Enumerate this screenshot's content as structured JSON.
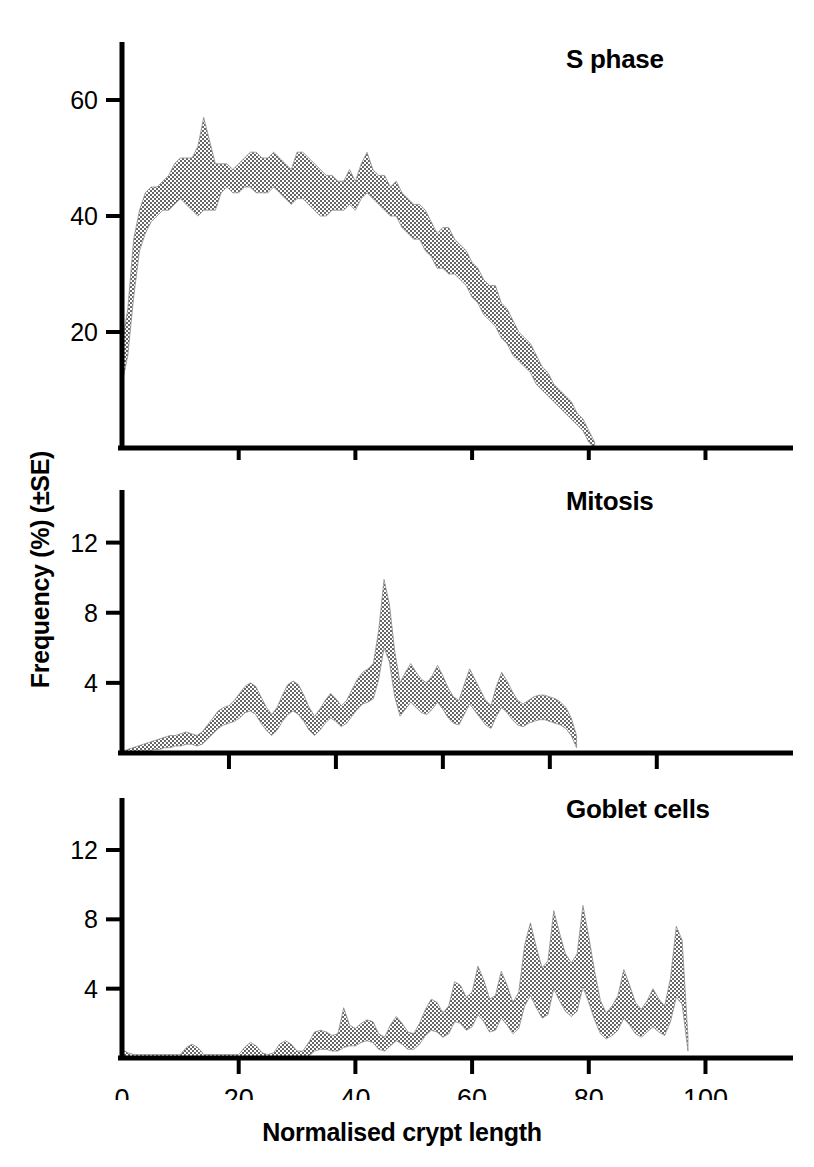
{
  "figure": {
    "xlabel": "Normalised crypt length",
    "ylabel": "Frequency (%) (±SE)",
    "band_color": "#a9a9a9",
    "axis_color": "#000000"
  },
  "chart_data": [
    {
      "type": "area",
      "title": "S phase",
      "xlabel": "Normalised crypt length",
      "ylabel": "Frequency (%) (±SE)",
      "xlim": [
        0,
        115
      ],
      "ylim": [
        0,
        70
      ],
      "xticks": [
        0,
        20,
        40,
        60,
        80,
        100
      ],
      "yticks": [
        20,
        40,
        60
      ],
      "grid": false,
      "legend": "none",
      "band": "±SE shaded region",
      "x": [
        0,
        1,
        2,
        3,
        4,
        5,
        6,
        7,
        8,
        9,
        10,
        11,
        12,
        13,
        14,
        15,
        16,
        17,
        18,
        19,
        20,
        21,
        22,
        23,
        24,
        25,
        26,
        27,
        28,
        29,
        30,
        31,
        32,
        33,
        34,
        35,
        36,
        37,
        38,
        39,
        40,
        41,
        42,
        43,
        44,
        45,
        46,
        47,
        48,
        49,
        50,
        51,
        52,
        53,
        54,
        55,
        56,
        57,
        58,
        59,
        60,
        61,
        62,
        63,
        64,
        65,
        66,
        67,
        68,
        69,
        70,
        71,
        72,
        73,
        74,
        75,
        76,
        77,
        78,
        79,
        80,
        81
      ],
      "upper": [
        18,
        24,
        36,
        41,
        44,
        45,
        45,
        46,
        47,
        49,
        50,
        50,
        50,
        52,
        57,
        53,
        49,
        49,
        49,
        48,
        49,
        50,
        51,
        51,
        50,
        50,
        51,
        50,
        49,
        48,
        51,
        51,
        50,
        49,
        48,
        47,
        47,
        46,
        46,
        48,
        46,
        49,
        51,
        48,
        47,
        47,
        45,
        46,
        44,
        43,
        42,
        42,
        41,
        39,
        37,
        38,
        38,
        36,
        35,
        34,
        32,
        31,
        29,
        28,
        28,
        25,
        24,
        22,
        20,
        19,
        18,
        16,
        14,
        13,
        11,
        10,
        9,
        8,
        6,
        5,
        3,
        1
      ],
      "lower": [
        11,
        16,
        26,
        34,
        37,
        39,
        40,
        41,
        41,
        42,
        43,
        42,
        41,
        40,
        41,
        41,
        41,
        44,
        45,
        44,
        44,
        45,
        45,
        44,
        44,
        44,
        45,
        44,
        43,
        42,
        43,
        43,
        42,
        41,
        40,
        40,
        41,
        41,
        41,
        42,
        41,
        43,
        44,
        43,
        42,
        41,
        40,
        40,
        38,
        37,
        36,
        36,
        34,
        33,
        31,
        31,
        30,
        30,
        29,
        28,
        26,
        25,
        23,
        22,
        21,
        19,
        18,
        16,
        15,
        14,
        13,
        11,
        10,
        9,
        8,
        7,
        6,
        5,
        4,
        3,
        1,
        0
      ],
      "mean": [
        14,
        20,
        31,
        37,
        40,
        42,
        42,
        43,
        44,
        45,
        46,
        46,
        45,
        46,
        49,
        47,
        45,
        46,
        47,
        46,
        46,
        47,
        48,
        47,
        47,
        47,
        48,
        47,
        46,
        45,
        47,
        47,
        46,
        45,
        44,
        43,
        44,
        43,
        43,
        45,
        43,
        46,
        47,
        45,
        44,
        44,
        42,
        43,
        41,
        40,
        39,
        39,
        37,
        36,
        34,
        34,
        34,
        33,
        32,
        31,
        29,
        28,
        26,
        25,
        24,
        22,
        21,
        19,
        17,
        16,
        15,
        13,
        12,
        11,
        9,
        8,
        7,
        6,
        5,
        4,
        2,
        0
      ]
    },
    {
      "type": "area",
      "title": "Mitosis",
      "xlabel": "Normalised crypt length",
      "ylabel": "Frequency (%) (±SE)",
      "xlim": [
        0,
        115
      ],
      "ylim": [
        0,
        15
      ],
      "xticks": [
        0,
        20,
        40,
        60,
        80,
        100
      ],
      "yticks": [
        4,
        8,
        12
      ],
      "grid": false,
      "legend": "none",
      "band": "±SE shaded region",
      "x": [
        0,
        1,
        2,
        3,
        4,
        5,
        6,
        7,
        8,
        9,
        10,
        11,
        12,
        13,
        14,
        15,
        16,
        17,
        18,
        19,
        20,
        21,
        22,
        23,
        24,
        25,
        26,
        27,
        28,
        29,
        30,
        31,
        32,
        33,
        34,
        35,
        36,
        37,
        38,
        39,
        40,
        41,
        42,
        43,
        44,
        45,
        46,
        47,
        48,
        49,
        50,
        51,
        52,
        53,
        54,
        55,
        56,
        57,
        58,
        59,
        60,
        61,
        62,
        63,
        64,
        65,
        66,
        67,
        68,
        69,
        70,
        71,
        72,
        73,
        74,
        75,
        76,
        77,
        78,
        79,
        80,
        81,
        82,
        83,
        84,
        85
      ],
      "upper": [
        0.1,
        0.2,
        0.3,
        0.4,
        0.5,
        0.6,
        0.7,
        0.8,
        0.9,
        1.0,
        1.0,
        1.1,
        1.2,
        1.1,
        1.0,
        1.2,
        1.6,
        2.0,
        2.4,
        2.6,
        2.7,
        3.0,
        3.4,
        3.8,
        4.0,
        3.8,
        3.2,
        2.6,
        2.2,
        2.6,
        3.3,
        3.9,
        4.1,
        3.9,
        3.3,
        2.6,
        2.1,
        2.5,
        3.0,
        3.4,
        3.1,
        2.7,
        3.0,
        3.6,
        4.2,
        4.6,
        4.8,
        5.1,
        7.0,
        9.9,
        8.5,
        5.8,
        4.0,
        4.6,
        5.1,
        4.6,
        4.2,
        4.0,
        4.4,
        5.0,
        4.4,
        3.7,
        3.2,
        3.0,
        3.9,
        4.8,
        4.2,
        3.6,
        3.0,
        2.7,
        3.8,
        4.6,
        4.1,
        3.5,
        3.0,
        2.8,
        3.0,
        3.2,
        3.3,
        3.3,
        3.2,
        3.1,
        2.9,
        2.6,
        2.0,
        1.0
      ],
      "lower": [
        0.0,
        0.0,
        0.0,
        0.0,
        0.1,
        0.1,
        0.2,
        0.2,
        0.3,
        0.3,
        0.4,
        0.4,
        0.5,
        0.5,
        0.4,
        0.5,
        0.8,
        1.1,
        1.4,
        1.6,
        1.7,
        1.8,
        2.0,
        2.3,
        2.4,
        2.2,
        1.7,
        1.3,
        1.0,
        1.3,
        1.8,
        2.2,
        2.4,
        2.2,
        1.8,
        1.3,
        1.0,
        1.3,
        1.7,
        2.0,
        1.8,
        1.5,
        1.7,
        2.1,
        2.5,
        2.8,
        2.9,
        3.1,
        4.2,
        6.0,
        5.2,
        3.2,
        2.1,
        2.5,
        2.9,
        2.6,
        2.3,
        2.2,
        2.5,
        2.9,
        2.5,
        2.0,
        1.7,
        1.6,
        2.2,
        2.8,
        2.4,
        2.0,
        1.6,
        1.4,
        2.1,
        2.6,
        2.3,
        1.9,
        1.6,
        1.5,
        1.7,
        1.8,
        1.9,
        1.9,
        1.8,
        1.7,
        1.6,
        1.4,
        1.0,
        0.3
      ],
      "mean": [
        0.05,
        0.1,
        0.15,
        0.2,
        0.3,
        0.35,
        0.45,
        0.5,
        0.6,
        0.65,
        0.7,
        0.75,
        0.85,
        0.8,
        0.7,
        0.85,
        1.2,
        1.55,
        1.9,
        2.1,
        2.2,
        2.4,
        2.7,
        3.05,
        3.2,
        3.0,
        2.45,
        1.95,
        1.6,
        1.95,
        2.55,
        3.05,
        3.25,
        3.05,
        2.55,
        1.95,
        1.55,
        1.9,
        2.35,
        2.7,
        2.45,
        2.1,
        2.35,
        2.85,
        3.35,
        3.7,
        3.85,
        4.1,
        5.6,
        7.95,
        6.85,
        4.5,
        3.05,
        3.55,
        4.0,
        3.6,
        3.25,
        3.1,
        3.45,
        3.95,
        3.45,
        2.85,
        2.45,
        2.3,
        3.05,
        3.8,
        3.3,
        2.8,
        2.3,
        2.05,
        2.95,
        3.6,
        3.2,
        2.7,
        2.3,
        2.15,
        2.35,
        2.5,
        2.6,
        2.6,
        2.5,
        2.4,
        2.25,
        2.0,
        1.5,
        0.65
      ]
    },
    {
      "type": "area",
      "title": "Goblet cells",
      "xlabel": "Normalised crypt length",
      "ylabel": "Frequency (%) (±SE)",
      "xlim": [
        0,
        115
      ],
      "ylim": [
        0,
        15
      ],
      "xticks": [
        0,
        20,
        40,
        60,
        80,
        100
      ],
      "yticks": [
        4,
        8,
        12
      ],
      "grid": false,
      "legend": "none",
      "band": "±SE shaded region",
      "x": [
        0,
        1,
        2,
        3,
        4,
        5,
        6,
        7,
        8,
        9,
        10,
        11,
        12,
        13,
        14,
        15,
        16,
        17,
        18,
        19,
        20,
        21,
        22,
        23,
        24,
        25,
        26,
        27,
        28,
        29,
        30,
        31,
        32,
        33,
        34,
        35,
        36,
        37,
        38,
        39,
        40,
        41,
        42,
        43,
        44,
        45,
        46,
        47,
        48,
        49,
        50,
        51,
        52,
        53,
        54,
        55,
        56,
        57,
        58,
        59,
        60,
        61,
        62,
        63,
        64,
        65,
        66,
        67,
        68,
        69,
        70,
        71,
        72,
        73,
        74,
        75,
        76,
        77,
        78,
        79,
        80,
        81,
        82,
        83,
        84,
        85,
        86,
        87,
        88,
        89,
        90,
        91,
        92,
        93,
        94,
        95,
        96,
        97
      ],
      "upper": [
        0.5,
        0.3,
        0.2,
        0.2,
        0.2,
        0.2,
        0.2,
        0.2,
        0.2,
        0.2,
        0.2,
        0.6,
        0.8,
        0.6,
        0.2,
        0.2,
        0.2,
        0.2,
        0.2,
        0.2,
        0.2,
        0.6,
        0.9,
        0.7,
        0.3,
        0.2,
        0.3,
        0.8,
        1.0,
        0.8,
        0.4,
        0.4,
        0.9,
        1.5,
        1.6,
        1.5,
        1.3,
        1.4,
        2.9,
        1.9,
        1.7,
        2.0,
        2.2,
        2.1,
        1.4,
        1.2,
        1.9,
        2.4,
        2.0,
        1.5,
        1.4,
        2.0,
        2.8,
        3.4,
        3.2,
        2.6,
        3.0,
        4.4,
        4.2,
        3.5,
        3.8,
        5.3,
        4.5,
        3.4,
        3.6,
        5.0,
        4.2,
        3.2,
        3.8,
        6.5,
        7.8,
        6.4,
        5.2,
        5.6,
        8.5,
        7.2,
        6.0,
        5.5,
        6.0,
        8.8,
        7.0,
        5.0,
        3.3,
        2.6,
        3.0,
        3.6,
        5.1,
        4.2,
        3.2,
        2.8,
        3.3,
        4.0,
        3.4,
        3.0,
        4.6,
        7.6,
        6.8,
        1.2
      ],
      "lower": [
        0.0,
        0.0,
        0.0,
        0.0,
        0.0,
        0.0,
        0.0,
        0.0,
        0.0,
        0.0,
        0.0,
        0.0,
        0.0,
        0.0,
        0.0,
        0.0,
        0.0,
        0.0,
        0.0,
        0.0,
        0.0,
        0.0,
        0.0,
        0.0,
        0.0,
        0.0,
        0.0,
        0.0,
        0.0,
        0.0,
        0.0,
        0.0,
        0.1,
        0.4,
        0.5,
        0.5,
        0.4,
        0.4,
        0.6,
        0.7,
        0.7,
        0.9,
        1.0,
        0.9,
        0.5,
        0.4,
        0.7,
        1.0,
        0.8,
        0.5,
        0.5,
        0.8,
        1.3,
        1.6,
        1.5,
        1.2,
        1.4,
        2.1,
        2.0,
        1.6,
        1.8,
        2.5,
        2.1,
        1.5,
        1.6,
        2.3,
        1.9,
        1.4,
        1.7,
        3.0,
        3.6,
        2.9,
        2.3,
        2.5,
        4.0,
        3.3,
        2.7,
        2.4,
        2.7,
        4.1,
        3.2,
        2.2,
        1.4,
        1.1,
        1.3,
        1.6,
        2.3,
        1.9,
        1.4,
        1.2,
        1.5,
        1.8,
        1.5,
        1.3,
        2.1,
        3.5,
        3.1,
        0.4
      ],
      "mean": [
        0.25,
        0.15,
        0.1,
        0.1,
        0.1,
        0.1,
        0.1,
        0.1,
        0.1,
        0.1,
        0.1,
        0.3,
        0.4,
        0.3,
        0.1,
        0.1,
        0.1,
        0.1,
        0.1,
        0.1,
        0.1,
        0.3,
        0.45,
        0.35,
        0.15,
        0.1,
        0.15,
        0.4,
        0.5,
        0.4,
        0.2,
        0.2,
        0.5,
        0.95,
        1.05,
        1.0,
        0.85,
        0.9,
        1.75,
        1.3,
        1.2,
        1.45,
        1.6,
        1.5,
        0.95,
        0.8,
        1.3,
        1.7,
        1.4,
        1.0,
        0.95,
        1.4,
        2.05,
        2.5,
        2.35,
        1.9,
        2.2,
        3.25,
        3.1,
        2.55,
        2.8,
        3.9,
        3.3,
        2.45,
        2.6,
        3.65,
        3.05,
        2.3,
        2.75,
        4.75,
        5.7,
        4.65,
        3.75,
        4.05,
        6.25,
        5.25,
        4.35,
        3.95,
        4.35,
        6.45,
        5.1,
        3.6,
        2.35,
        1.85,
        2.15,
        2.6,
        3.7,
        3.05,
        2.3,
        2.0,
        2.4,
        2.9,
        2.45,
        2.15,
        3.35,
        5.55,
        4.95,
        0.8
      ]
    }
  ]
}
